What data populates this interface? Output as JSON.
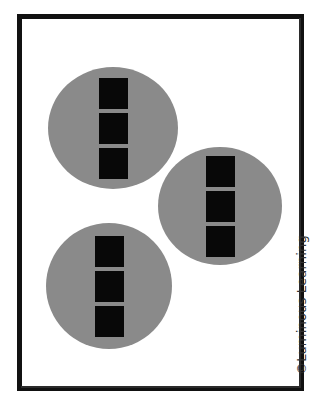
{
  "worksheet": {
    "background_color": "#ffffff",
    "frame": {
      "name": "border-frame",
      "color": "#111111",
      "thickness_px": 5
    },
    "watermark": {
      "text": "©Luminous Learning",
      "orientation": "vertical-rotated-90-ccw",
      "color": "#333333"
    },
    "group_shape": "circle",
    "unit_shape": "square",
    "group_color": "#8a8a8a",
    "unit_color": "#080808",
    "groups": [
      {
        "id": "group-1",
        "label": "group 1",
        "position": "top-left",
        "unit_count": 3,
        "units": [
          {
            "id": "g1-unit-1",
            "label": "square 1"
          },
          {
            "id": "g1-unit-2",
            "label": "square 2"
          },
          {
            "id": "g1-unit-3",
            "label": "square 3"
          }
        ]
      },
      {
        "id": "group-2",
        "label": "group 2",
        "position": "middle-right",
        "unit_count": 3,
        "units": [
          {
            "id": "g2-unit-1",
            "label": "square 1"
          },
          {
            "id": "g2-unit-2",
            "label": "square 2"
          },
          {
            "id": "g2-unit-3",
            "label": "square 3"
          }
        ]
      },
      {
        "id": "group-3",
        "label": "group 3",
        "position": "bottom-left",
        "unit_count": 3,
        "units": [
          {
            "id": "g3-unit-1",
            "label": "square 1"
          },
          {
            "id": "g3-unit-2",
            "label": "square 2"
          },
          {
            "id": "g3-unit-3",
            "label": "square 3"
          }
        ]
      }
    ],
    "total_groups": 3,
    "units_per_group": 3,
    "total_units": 9
  }
}
